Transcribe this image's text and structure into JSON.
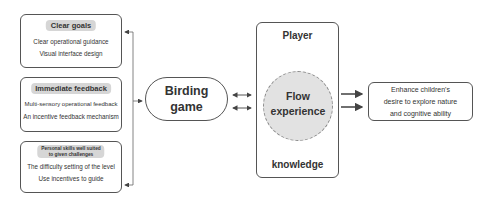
{
  "left_boxes": [
    {
      "title": "Clear goals",
      "lines": [
        "Clear operational guidance",
        "Visual interface design"
      ]
    },
    {
      "title": "Immediate feedback",
      "lines": [
        "Multi-sensory operational feedback",
        "An incentive feedback mechanism"
      ]
    },
    {
      "title_line1": "Personal skills well suited",
      "title_line2": "to given challenges",
      "lines": [
        "The difficulty setting of the level",
        "Use incentives to guide"
      ]
    }
  ],
  "center_node": {
    "line1": "Birding",
    "line2": "game"
  },
  "flow_container": {
    "top_label": "Player",
    "circle_line1": "Flow",
    "circle_line2": "experience",
    "bottom_label": "knowledge"
  },
  "outcome": {
    "line1": "Enhance children's",
    "line2": "desire to explore nature",
    "line3": "and cognitive ability"
  },
  "colors": {
    "border": "#555555",
    "tag_fill": "#d6d6d6",
    "circle_fill": "#e2e2e2",
    "arrow": "#444444"
  }
}
